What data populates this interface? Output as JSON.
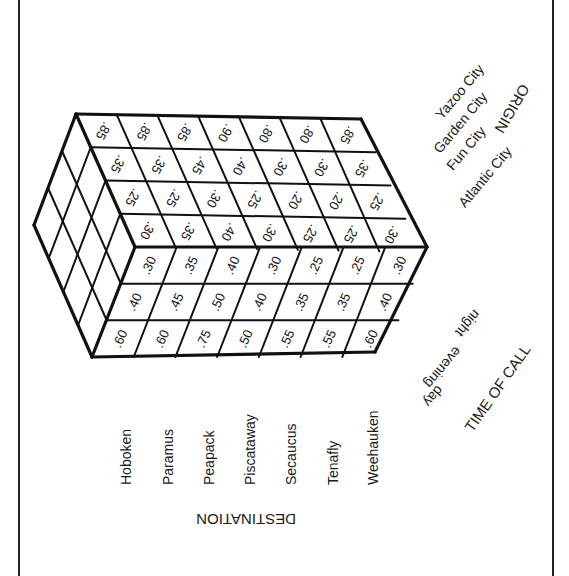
{
  "diagram": {
    "type": "3d-table-cube",
    "axes": {
      "destination": {
        "title": "DESTINATION",
        "items": [
          "Hoboken",
          "Paramus",
          "Peapack",
          "Piscataway",
          "Secaucus",
          "Tenafly",
          "Weehauken"
        ]
      },
      "origin": {
        "title": "ORIGIN",
        "items": [
          "Yazoo City",
          "Garden City",
          "Fun City",
          "Atlantic City"
        ]
      },
      "time_of_call": {
        "title": "TIME OF CALL",
        "items": [
          "night",
          "evening",
          "day"
        ]
      }
    },
    "top_face": {
      "description": "Origin (rows) × Destination (columns)",
      "rows": [
        {
          "origin": "Yazoo City",
          "values": [
            ".85",
            ".85",
            ".85",
            ".90",
            ".80",
            ".80",
            ".85"
          ]
        },
        {
          "origin": "Garden City",
          "values": [
            ".35",
            ".35",
            ".45",
            ".40",
            ".30",
            ".30",
            ".35"
          ]
        },
        {
          "origin": "Fun City",
          "values": [
            ".25",
            ".25",
            ".30",
            ".25",
            ".20",
            ".20",
            ".25"
          ]
        },
        {
          "origin": "Atlantic City",
          "values": [
            ".30",
            ".35",
            ".40",
            ".30",
            ".25",
            ".25",
            ".30"
          ]
        }
      ]
    },
    "front_face": {
      "description": "Time of call (rows) × Destination (columns)",
      "rows": [
        {
          "time": "night",
          "values": [
            ".30",
            ".35",
            ".40",
            ".30",
            ".25",
            ".25",
            ".30"
          ]
        },
        {
          "time": "evening",
          "values": [
            ".40",
            ".45",
            ".50",
            ".40",
            ".35",
            ".35",
            ".40"
          ]
        },
        {
          "time": "day",
          "values": [
            ".60",
            ".60",
            ".75",
            ".50",
            ".55",
            ".55",
            ".60"
          ]
        }
      ]
    },
    "left_face": {
      "description": "Origin × Time of call (blank cells)",
      "rows": 4,
      "cols": 3
    },
    "colors": {
      "line": "#111111",
      "background": "#ffffff"
    }
  }
}
